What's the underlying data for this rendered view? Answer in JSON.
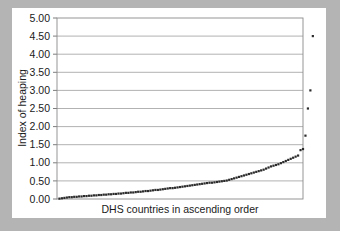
{
  "figure": {
    "background_color": "#b4b4b4",
    "card_color": "#ffffff"
  },
  "chart_data": {
    "type": "scatter",
    "title": "",
    "subtitle": "",
    "xlabel": "DHS countries in ascending order",
    "ylabel": "Index of heaping",
    "xlim": [
      0,
      100
    ],
    "ylim": [
      0.0,
      5.0
    ],
    "grid": true,
    "grid_axis": "y",
    "legend": false,
    "legend_position": "none",
    "marker_color": "#2b2b2b",
    "gridline_color": "#a9a9a9",
    "frame_color": "#8a8a8a",
    "ytick_labels": [
      "5.00",
      "4.50",
      "4.00",
      "3.50",
      "3.00",
      "2.50",
      "2.00",
      "1.50",
      "1.00",
      "0.50",
      "0.00"
    ],
    "ytick_values": [
      5.0,
      4.5,
      4.0,
      3.5,
      3.0,
      2.5,
      2.0,
      1.5,
      1.0,
      0.5,
      0.0
    ],
    "xtick_labels": [],
    "series": [
      {
        "name": "Index of heaping",
        "x": [
          1,
          2,
          3,
          4,
          5,
          6,
          7,
          8,
          9,
          10,
          11,
          12,
          13,
          14,
          15,
          16,
          17,
          18,
          19,
          20,
          21,
          22,
          23,
          24,
          25,
          26,
          27,
          28,
          29,
          30,
          31,
          32,
          33,
          34,
          35,
          36,
          37,
          38,
          39,
          40,
          41,
          42,
          43,
          44,
          45,
          46,
          47,
          48,
          49,
          50,
          51,
          52,
          53,
          54,
          55,
          56,
          57,
          58,
          59,
          60,
          61,
          62,
          63,
          64,
          65,
          66,
          67,
          68,
          69,
          70,
          71,
          72,
          73,
          74,
          75,
          76,
          77,
          78,
          79,
          80,
          81,
          82,
          83,
          84,
          85,
          86,
          87,
          88,
          89,
          90,
          91,
          92,
          93,
          94,
          95,
          96,
          97,
          98
        ],
        "y": [
          0.01,
          0.02,
          0.03,
          0.04,
          0.05,
          0.05,
          0.06,
          0.06,
          0.07,
          0.07,
          0.08,
          0.08,
          0.09,
          0.09,
          0.1,
          0.1,
          0.11,
          0.11,
          0.12,
          0.12,
          0.13,
          0.13,
          0.14,
          0.14,
          0.15,
          0.15,
          0.16,
          0.17,
          0.17,
          0.18,
          0.18,
          0.19,
          0.2,
          0.2,
          0.21,
          0.22,
          0.22,
          0.23,
          0.24,
          0.25,
          0.25,
          0.26,
          0.27,
          0.28,
          0.29,
          0.3,
          0.3,
          0.31,
          0.32,
          0.33,
          0.34,
          0.35,
          0.36,
          0.37,
          0.38,
          0.39,
          0.4,
          0.41,
          0.42,
          0.43,
          0.44,
          0.45,
          0.45,
          0.46,
          0.47,
          0.48,
          0.49,
          0.5,
          0.51,
          0.53,
          0.55,
          0.57,
          0.59,
          0.61,
          0.63,
          0.65,
          0.67,
          0.69,
          0.71,
          0.73,
          0.75,
          0.77,
          0.79,
          0.81,
          0.84,
          0.87,
          0.9,
          0.92,
          0.94,
          0.96,
          0.99,
          1.02,
          1.05,
          1.08,
          1.11,
          1.14,
          1.17,
          1.2
        ]
      },
      {
        "name": "Outliers",
        "x": [
          99,
          100,
          101,
          102,
          103,
          104
        ],
        "y": [
          1.35,
          1.38,
          1.75,
          2.5,
          3.0,
          4.5
        ]
      }
    ]
  }
}
